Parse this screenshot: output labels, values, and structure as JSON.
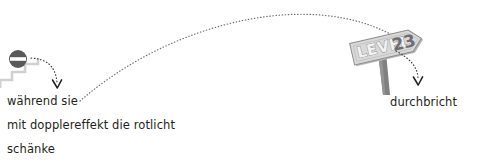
{
  "scene": {
    "width": 477,
    "height": 162,
    "background": "#ffffff"
  },
  "colors": {
    "ink": "#231f20",
    "dotted_line": "#6d6e71",
    "sign_face": "#d9d9d9",
    "sign_face_dark": "#bfbfbf",
    "sign_outline": "#8c8c8c",
    "sign_post": "#808080",
    "stairs": "#d0d0d0",
    "icon_disc": "#595959",
    "number_fill": "#6d6e71",
    "level_letter_fill": "#f2f2f2",
    "level_letter_stroke": "#a6a6a6"
  },
  "icons": {
    "no_entry": {
      "name": "no-entry-icon",
      "label": "no-entry-sign",
      "cx": 18,
      "cy": 59,
      "r": 9
    },
    "stairs": {
      "name": "stairs-icon",
      "label": "staircase"
    },
    "signpost": {
      "name": "level-signpost-icon",
      "label": "level-signpost"
    }
  },
  "sign": {
    "level_word": "LEVEL",
    "level_number": "23",
    "rotation_deg": -13
  },
  "trajectory": {
    "name": "trajectory-arc",
    "label": "dotted-parabolic-arc",
    "path": "M 80 101 C 150 40, 250 6, 330 16 C 370 21, 395 35, 412 48"
  },
  "annotations": [
    {
      "id": "arrow-from-icon",
      "name": "arrow-icon-to-caption",
      "label": "curved-dotted-arrow-down",
      "path": "M 31 58 C 45 59, 54 64, 57 84"
    },
    {
      "id": "arrow-from-sign",
      "name": "arrow-sign-to-caption",
      "label": "curved-dotted-arrow-down",
      "path": "M 397 52 C 412 60, 418 68, 418 81"
    }
  ],
  "captions": {
    "left": {
      "lines": [
        "während sie",
        "mit dopplereffekt die rotlicht",
        "schänke"
      ]
    },
    "right": {
      "text": "durchbricht"
    }
  }
}
